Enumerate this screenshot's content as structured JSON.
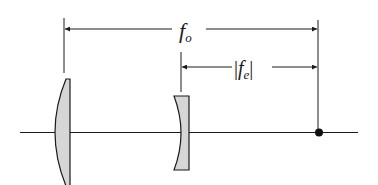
{
  "diagram": {
    "title": "",
    "labels": {
      "objective_focal_length": {
        "main": "f",
        "sub": "o"
      },
      "eyepiece_focal_length": {
        "left_bar": "|",
        "main": "f",
        "sub": "e",
        "right_bar": "|"
      }
    },
    "elements": [
      "optical-axis",
      "objective-lens (converging, plano-convex)",
      "eyepiece-lens (diverging, plano-concave)",
      "focal-point",
      "dimension arrow f_o",
      "dimension arrow |f_e|"
    ],
    "colors": {
      "line": "#1a1a1a",
      "lens_fill": "#d6d6d6"
    }
  }
}
